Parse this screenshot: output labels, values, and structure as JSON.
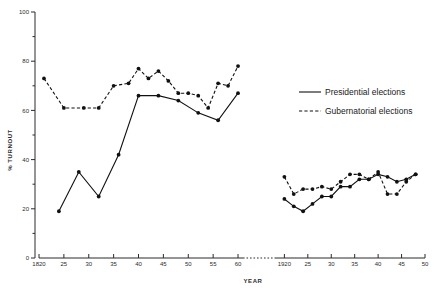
{
  "chart_data": {
    "type": "line",
    "title": "",
    "xlabel": "YEAR",
    "ylabel": "% TURNOUT",
    "ylim": [
      0,
      100
    ],
    "y_ticks": [
      0,
      20,
      40,
      60,
      80,
      100
    ],
    "y_minor_step": 10,
    "grid": false,
    "legend_position": "right",
    "axis_break": true,
    "panels": [
      {
        "name": "left-panel",
        "xlim": [
          1820,
          1861
        ],
        "x_ticks": [
          1820,
          1825,
          1830,
          1835,
          1840,
          1845,
          1850,
          1855,
          1860
        ],
        "x_tick_labels": [
          "1820",
          "25",
          "30",
          "35",
          "40",
          "45",
          "50",
          "55",
          "60"
        ]
      },
      {
        "name": "right-panel",
        "xlim": [
          1918,
          1950
        ],
        "x_ticks": [
          1920,
          1925,
          1930,
          1935,
          1940,
          1945,
          1950
        ],
        "x_tick_labels": [
          "1920",
          "25",
          "30",
          "35",
          "40",
          "45",
          "50"
        ]
      }
    ],
    "series": [
      {
        "name": "Presidential elections",
        "style": "solid",
        "segments": [
          {
            "panel": "left-panel",
            "x": [
              1824,
              1828,
              1832,
              1836,
              1840,
              1844,
              1848,
              1852,
              1856,
              1860
            ],
            "y": [
              19,
              35,
              25,
              42,
              66,
              66,
              64,
              59,
              56,
              67
            ]
          },
          {
            "panel": "right-panel",
            "x": [
              1920,
              1922,
              1924,
              1926,
              1928,
              1930,
              1932,
              1934,
              1936,
              1938,
              1940,
              1942,
              1944,
              1946,
              1948
            ],
            "y": [
              24,
              21,
              19,
              22,
              25,
              25,
              29,
              29,
              32,
              32,
              34,
              33,
              31,
              32,
              34
            ]
          }
        ]
      },
      {
        "name": "Gubernatorial elections",
        "style": "dashed",
        "segments": [
          {
            "panel": "left-panel",
            "x": [
              1821,
              1825,
              1829,
              1832,
              1835,
              1838,
              1840,
              1842,
              1844,
              1846,
              1848,
              1850,
              1852,
              1854,
              1856,
              1858,
              1860
            ],
            "y": [
              73,
              61,
              61,
              61,
              70,
              71,
              77,
              73,
              76,
              72,
              67,
              67,
              66,
              61,
              71,
              70,
              78
            ]
          },
          {
            "panel": "right-panel",
            "x": [
              1920,
              1922,
              1924,
              1926,
              1928,
              1930,
              1932,
              1934,
              1936,
              1938,
              1940,
              1942,
              1944,
              1946,
              1948
            ],
            "y": [
              33,
              26,
              28,
              28,
              29,
              28,
              31,
              34,
              34,
              32,
              35,
              26,
              26,
              31,
              34
            ]
          }
        ]
      }
    ]
  },
  "legend": {
    "items": [
      {
        "label": "Presidential elections",
        "style": "solid"
      },
      {
        "label": "Gubernatorial elections",
        "style": "dashed"
      }
    ]
  }
}
